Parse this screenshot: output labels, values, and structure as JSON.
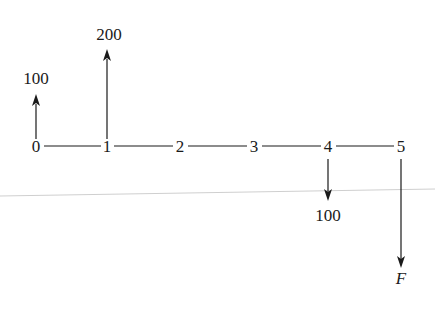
{
  "diagram": {
    "type": "cash-flow-diagram",
    "periods": [
      "0",
      "1",
      "2",
      "3",
      "4",
      "5"
    ],
    "period_x": [
      36,
      107,
      180,
      254,
      328,
      401
    ],
    "axis_y": 145,
    "cash_flows": [
      {
        "period": 0,
        "direction": "up",
        "label": "100",
        "arrow_top": 95,
        "label_y": 84
      },
      {
        "period": 1,
        "direction": "up",
        "label": "200",
        "arrow_top": 50,
        "label_y": 40
      },
      {
        "period": 4,
        "direction": "down",
        "label": "100",
        "arrow_bottom": 200,
        "label_y": 221
      },
      {
        "period": 5,
        "direction": "down",
        "label": "F",
        "arrow_bottom": 268,
        "label_y": 284,
        "italic": true
      }
    ],
    "colors": {
      "ink": "#1a1a1a",
      "guide_line": "#c8c8c8",
      "background": "#ffffff"
    }
  },
  "labels": {
    "p0": "0",
    "p1": "1",
    "p2": "2",
    "p3": "3",
    "p4": "4",
    "p5": "5",
    "cf0": "100",
    "cf1": "200",
    "cf4": "100",
    "cf5": "F"
  }
}
